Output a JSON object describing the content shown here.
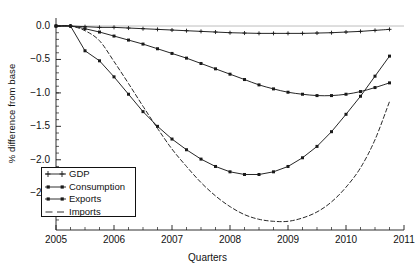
{
  "chart_data": {
    "type": "line",
    "title": "",
    "xlabel": "Quarters",
    "ylabel": "% difference from base",
    "xlim": [
      2005.0,
      2011.0
    ],
    "ylim": [
      -3.05,
      0.12
    ],
    "xticks": [
      "2005",
      "2006",
      "2007",
      "2008",
      "2009",
      "2010",
      "2011"
    ],
    "xtick_values": [
      2005,
      2006,
      2007,
      2008,
      2009,
      2010,
      2011
    ],
    "yticks": [
      "0.0",
      "-0.5",
      "-1.0",
      "-1.5",
      "-2.0",
      "-2.5"
    ],
    "ytick_values": [
      0.0,
      -0.5,
      -1.0,
      -1.5,
      -2.0,
      -2.5
    ],
    "grid": false,
    "legend_position": "lower-left",
    "x": [
      2005.0,
      2005.25,
      2005.5,
      2005.75,
      2006.0,
      2006.25,
      2006.5,
      2006.75,
      2007.0,
      2007.25,
      2007.5,
      2007.75,
      2008.0,
      2008.25,
      2008.5,
      2008.75,
      2009.0,
      2009.25,
      2009.5,
      2009.75,
      2010.0,
      2010.25,
      2010.5,
      2010.75
    ],
    "series": [
      {
        "name": "GDP",
        "marker": "plus",
        "style": "solid",
        "color": "#1a1a1a",
        "values": [
          0.0,
          0.0,
          -0.01,
          -0.02,
          -0.02,
          -0.03,
          -0.04,
          -0.05,
          -0.06,
          -0.07,
          -0.08,
          -0.09,
          -0.1,
          -0.105,
          -0.11,
          -0.11,
          -0.11,
          -0.11,
          -0.105,
          -0.1,
          -0.09,
          -0.08,
          -0.065,
          -0.05
        ]
      },
      {
        "name": "Consumption",
        "marker": "square",
        "style": "solid",
        "color": "#1a1a1a",
        "values": [
          0.0,
          0.0,
          -0.04,
          -0.09,
          -0.15,
          -0.21,
          -0.27,
          -0.34,
          -0.41,
          -0.48,
          -0.56,
          -0.64,
          -0.72,
          -0.8,
          -0.88,
          -0.94,
          -0.99,
          -1.02,
          -1.04,
          -1.04,
          -1.02,
          -0.98,
          -0.92,
          -0.85
        ]
      },
      {
        "name": "Exports",
        "marker": "square",
        "style": "solid",
        "color": "#1a1a1a",
        "values": [
          0.0,
          0.0,
          -0.37,
          -0.52,
          -0.76,
          -1.02,
          -1.28,
          -1.5,
          -1.69,
          -1.85,
          -1.99,
          -2.1,
          -2.18,
          -2.22,
          -2.22,
          -2.18,
          -2.1,
          -1.97,
          -1.8,
          -1.58,
          -1.32,
          -1.05,
          -0.75,
          -0.45
        ]
      },
      {
        "name": "Imports",
        "marker": "none",
        "style": "dashed",
        "color": "#1a1a1a",
        "values": [
          0.0,
          0.0,
          -0.07,
          -0.22,
          -0.53,
          -0.86,
          -1.2,
          -1.53,
          -1.84,
          -2.1,
          -2.34,
          -2.54,
          -2.7,
          -2.82,
          -2.89,
          -2.92,
          -2.92,
          -2.87,
          -2.78,
          -2.63,
          -2.41,
          -2.12,
          -1.7,
          -1.13
        ]
      }
    ]
  },
  "legend": {
    "entries": [
      {
        "label": "GDP"
      },
      {
        "label": "Consumption"
      },
      {
        "label": "Exports"
      },
      {
        "label": "Imports"
      }
    ]
  }
}
